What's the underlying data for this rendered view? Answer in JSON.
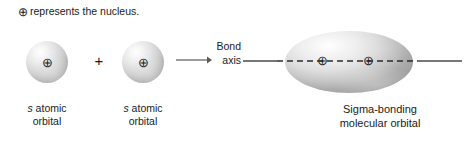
{
  "figure": {
    "note": {
      "symbol": "⊕",
      "text": "represents the nucleus."
    },
    "reactants": {
      "plus_operator": "+",
      "left_orbital": {
        "nucleus_symbol": "⊕",
        "label_line1_italic": "s",
        "label_line1_rest": " atomic",
        "label_line2": "orbital"
      },
      "right_orbital": {
        "nucleus_symbol": "⊕",
        "label_line1_italic": "s",
        "label_line1_rest": " atomic",
        "label_line2": "orbital"
      }
    },
    "reaction_arrow": {
      "direction": "right"
    },
    "bond_axis": {
      "label_line1": "Bond",
      "label_line2": "axis"
    },
    "product": {
      "nucleus_symbol_1": "⊕",
      "nucleus_symbol_2": "⊕",
      "label_line1": "Sigma-bonding",
      "label_line2": "molecular orbital"
    },
    "colors": {
      "background": "#ffffff",
      "text": "#1a1a1a",
      "line": "#4a4a4a",
      "sphere_highlight": "#ffffff",
      "sphere_shadow": "#8e8e8e"
    }
  }
}
